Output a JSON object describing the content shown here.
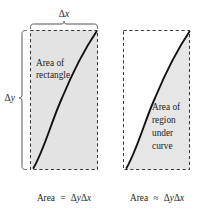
{
  "figure": {
    "colors": {
      "background": "#ffffff",
      "shading": "#e2e2e2",
      "shading_right": "#e6e6e6",
      "dashed_border": "#3a3a3a",
      "curve": "#111111",
      "brace": "#555555",
      "text": "#1d1d1d"
    }
  },
  "dimensions": {
    "horizontal": {
      "label_delta": "Δ",
      "label_var": "x",
      "full": "Δx",
      "name": "delta-x"
    },
    "vertical": {
      "label_delta": "Δ",
      "label_var": "y",
      "full": "Δy",
      "name": "delta-y"
    }
  },
  "panels": [
    {
      "id": "rectangle-panel",
      "label_lines": [
        "Area of",
        "rectangle"
      ],
      "caption": {
        "word": "Area",
        "relation": "=",
        "expression_delta1": "Δ",
        "expression_var1": "y",
        "expression_delta2": "Δ",
        "expression_var2": "x",
        "full": "Area = ΔyΔx"
      },
      "shaded": "entire-rectangle"
    },
    {
      "id": "region-panel",
      "label_lines": [
        "Area of",
        "region",
        "under",
        "curve"
      ],
      "caption": {
        "word": "Area",
        "relation": "≈",
        "expression_delta1": "Δ",
        "expression_var1": "y",
        "expression_delta2": "Δ",
        "expression_var2": "x",
        "full": "Area ≈ ΔyΔx"
      },
      "shaded": "region-right-of-curve"
    }
  ]
}
